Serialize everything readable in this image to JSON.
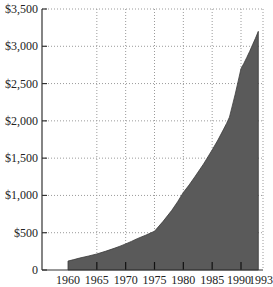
{
  "chart_data": {
    "type": "area",
    "title": "",
    "xlabel": "",
    "ylabel": "",
    "x": [
      1960,
      1962,
      1965,
      1968,
      1970,
      1972,
      1975,
      1978,
      1980,
      1982,
      1985,
      1987,
      1988,
      1990,
      1991,
      1992,
      1993
    ],
    "values": [
      120,
      160,
      215,
      290,
      350,
      420,
      520,
      800,
      1040,
      1250,
      1610,
      1890,
      2050,
      2700,
      2850,
      3020,
      3200
    ],
    "xticks": [
      "1960",
      "1965",
      "1970",
      "1975",
      "1980",
      "1985",
      "1990",
      "1993"
    ],
    "xtick_values": [
      1960,
      1965,
      1970,
      1975,
      1980,
      1985,
      1990,
      1993
    ],
    "yticks": [
      "0",
      "$500",
      "$1,000",
      "$1,500",
      "$2,000",
      "$2,500",
      "$3,000",
      "$3,500"
    ],
    "ytick_values": [
      0,
      500,
      1000,
      1500,
      2000,
      2500,
      3000,
      3500
    ],
    "xlim": [
      1955.5,
      1993
    ],
    "ylim": [
      0,
      3500
    ],
    "grid": true,
    "legend": null,
    "fill_color": "#5a5a5a"
  }
}
